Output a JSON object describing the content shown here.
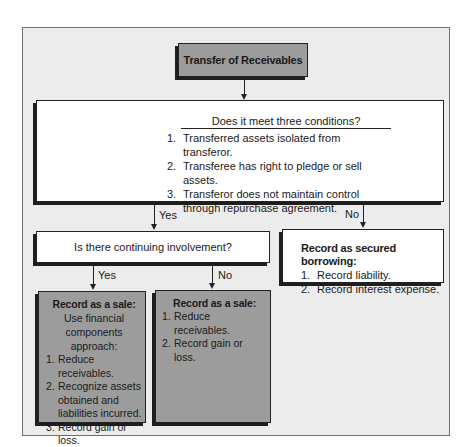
{
  "diagram": {
    "title": "Transfer of Receivables",
    "conditions": {
      "question": "Does it meet three conditions?",
      "items": [
        {
          "num": "1.",
          "text": "Transferred assets isolated from transferor."
        },
        {
          "num": "2.",
          "text": "Transferee has right to pledge or sell assets."
        },
        {
          "num": "3.",
          "text": "Transferor does not maintain control through repurchase agreement."
        }
      ]
    },
    "branch_yes_label": "Yes",
    "branch_no_label": "No",
    "continuing_involvement": {
      "question": "Is there continuing involvement?",
      "yes_label": "Yes",
      "no_label": "No"
    },
    "secured_borrowing": {
      "heading": "Record as secured borrowing:",
      "items": [
        {
          "num": "1.",
          "text": "Record liability."
        },
        {
          "num": "2.",
          "text": "Record interest expense."
        }
      ]
    },
    "sale_with_involvement": {
      "heading": "Record as a sale:",
      "intro": "Use financial components approach:",
      "items": [
        {
          "num": "1.",
          "text": "Reduce receivables."
        },
        {
          "num": "2.",
          "text": "Recognize assets obtained and liabilities incurred."
        },
        {
          "num": "3.",
          "text": "Record gain or loss."
        }
      ]
    },
    "sale_without_involvement": {
      "heading": "Record as a sale:",
      "items": [
        {
          "num": "1.",
          "text": "Reduce receivables."
        },
        {
          "num": "2.",
          "text": "Record gain or loss."
        }
      ]
    },
    "colors": {
      "frame_bg": "#ececec",
      "gray_box": "#9c9c9c",
      "shadow": "#1e1e1e",
      "white_box": "#ffffff"
    }
  }
}
